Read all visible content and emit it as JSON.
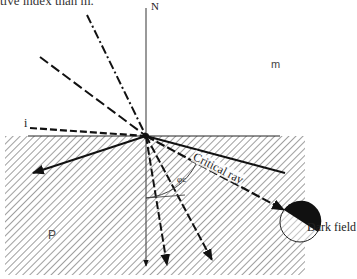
{
  "caption": "tive index than m.",
  "labels": {
    "normal": "N",
    "medium_upper": "m",
    "medium_lower": "P",
    "incident": "i",
    "critical_ray": "Critical ray",
    "angle": "φc",
    "dark_field": "Dark field"
  },
  "colors": {
    "ink": "#111111",
    "hatch": "#666666",
    "background": "#ffffff"
  },
  "geometry": {
    "origin": [
      146,
      136
    ],
    "interface_y": 136,
    "hatch_region": {
      "x": 5,
      "y": 136,
      "width": 300,
      "height": 139
    },
    "view_circle": {
      "cx": 300,
      "cy": 222,
      "r": 20
    }
  }
}
